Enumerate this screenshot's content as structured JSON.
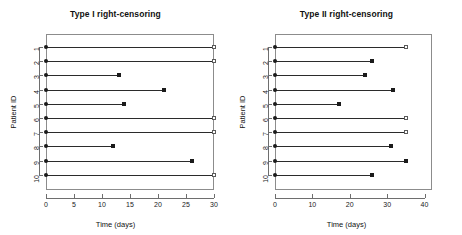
{
  "figure": {
    "panels": [
      {
        "id": "type-1",
        "title": "Type I right-censoring",
        "xlabel": "Time (days)",
        "ylabel": "Patient ID",
        "xlim": [
          0,
          30
        ],
        "xticks": [
          0,
          5,
          10,
          15,
          20,
          25,
          30
        ],
        "xticklabels": [
          "0",
          "5",
          "10",
          "15",
          "20",
          "25",
          "30"
        ],
        "yticklabels": [
          "1",
          "2",
          "3",
          "4",
          "5",
          "6",
          "7",
          "8",
          "9",
          "10"
        ],
        "rows": [
          {
            "id": "1",
            "start": 0,
            "stop": 30,
            "status": "censored"
          },
          {
            "id": "2",
            "start": 0,
            "stop": 30,
            "status": "censored"
          },
          {
            "id": "3",
            "start": 0,
            "stop": 13,
            "status": "event"
          },
          {
            "id": "4",
            "start": 0,
            "stop": 21,
            "status": "event"
          },
          {
            "id": "5",
            "start": 0,
            "stop": 14,
            "status": "event"
          },
          {
            "id": "6",
            "start": 0,
            "stop": 30,
            "status": "censored"
          },
          {
            "id": "7",
            "start": 0,
            "stop": 30,
            "status": "censored"
          },
          {
            "id": "8",
            "start": 0,
            "stop": 12,
            "status": "event"
          },
          {
            "id": "9",
            "start": 0,
            "stop": 26,
            "status": "event"
          },
          {
            "id": "10",
            "start": 0,
            "stop": 30,
            "status": "censored"
          }
        ]
      },
      {
        "id": "type-2",
        "title": "Type II right-censoring",
        "xlabel": "Time (days)",
        "ylabel": "Patient ID",
        "xlim": [
          0,
          42
        ],
        "xticks": [
          0,
          10,
          20,
          30,
          40
        ],
        "xticklabels": [
          "0",
          "10",
          "20",
          "30",
          "40"
        ],
        "yticklabels": [
          "1",
          "2",
          "3",
          "4",
          "5",
          "6",
          "7",
          "8",
          "9",
          "10"
        ],
        "rows": [
          {
            "id": "1",
            "start": 0,
            "stop": 35,
            "status": "censored"
          },
          {
            "id": "2",
            "start": 0,
            "stop": 26,
            "status": "event"
          },
          {
            "id": "3",
            "start": 0,
            "stop": 24,
            "status": "event"
          },
          {
            "id": "4",
            "start": 0,
            "stop": 31.5,
            "status": "event"
          },
          {
            "id": "5",
            "start": 0,
            "stop": 17,
            "status": "event"
          },
          {
            "id": "6",
            "start": 0,
            "stop": 35,
            "status": "censored"
          },
          {
            "id": "7",
            "start": 0,
            "stop": 35,
            "status": "censored"
          },
          {
            "id": "8",
            "start": 0,
            "stop": 31,
            "status": "event"
          },
          {
            "id": "9",
            "start": 0,
            "stop": 35,
            "status": "event"
          },
          {
            "id": "10",
            "start": 0,
            "stop": 26,
            "status": "event"
          }
        ]
      }
    ]
  },
  "chart_data": {
    "type": "scatter",
    "xlabel": "Time (days)",
    "ylabel": "Patient ID",
    "grid": false,
    "legend": "none",
    "marker_semantics": {
      "filled-circle": "entry / start of follow-up at time 0",
      "filled-square": "observed event (death / failure)",
      "open-square": "right-censored observation"
    },
    "panels": [
      {
        "name": "Type I right-censoring",
        "xlim": [
          0,
          30
        ],
        "xticks": [
          0,
          5,
          10,
          15,
          20,
          25,
          30
        ],
        "ylim": [
          1,
          10
        ],
        "categories": [
          "1",
          "2",
          "3",
          "4",
          "5",
          "6",
          "7",
          "8",
          "9",
          "10"
        ],
        "series": [
          {
            "name": "start",
            "values": [
              0,
              0,
              0,
              0,
              0,
              0,
              0,
              0,
              0,
              0
            ]
          },
          {
            "name": "stop",
            "values": [
              30,
              30,
              13,
              21,
              14,
              30,
              30,
              12,
              26,
              30
            ]
          },
          {
            "name": "event",
            "values": [
              0,
              0,
              1,
              1,
              1,
              0,
              0,
              1,
              1,
              0
            ]
          }
        ],
        "censoring_time": 30,
        "n_events": 5,
        "n_censored": 5
      },
      {
        "name": "Type II right-censoring",
        "xlim": [
          0,
          42
        ],
        "xticks": [
          0,
          10,
          20,
          30,
          40
        ],
        "ylim": [
          1,
          10
        ],
        "categories": [
          "1",
          "2",
          "3",
          "4",
          "5",
          "6",
          "7",
          "8",
          "9",
          "10"
        ],
        "series": [
          {
            "name": "start",
            "values": [
              0,
              0,
              0,
              0,
              0,
              0,
              0,
              0,
              0,
              0
            ]
          },
          {
            "name": "stop",
            "values": [
              35,
              26,
              24,
              31.5,
              17,
              35,
              35,
              31,
              35,
              26
            ]
          },
          {
            "name": "event",
            "values": [
              0,
              1,
              1,
              1,
              1,
              0,
              0,
              1,
              1,
              1
            ]
          }
        ],
        "n_events": 7,
        "n_censored": 3
      }
    ]
  }
}
